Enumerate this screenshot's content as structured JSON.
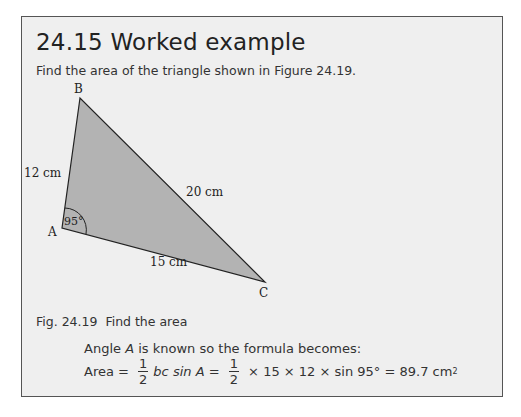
{
  "section": {
    "number": "24.15",
    "title": "Worked example",
    "intro": "Find the area of the triangle shown in Figure 24.19."
  },
  "figure": {
    "vertices": {
      "A": "A",
      "B": "B",
      "C": "C"
    },
    "sides": {
      "AB": "12 cm",
      "BC": "20 cm",
      "AC": "15 cm"
    },
    "angle_A": "95°",
    "fill_color": "#b3b3b3",
    "caption_number": "Fig. 24.19",
    "caption_text": "Find the area"
  },
  "solution": {
    "line1_pre": "Angle ",
    "line1_var": "A",
    "line1_post": " is known so the formula becomes:",
    "area_label": "Area = ",
    "frac_num": "1",
    "frac_den": "2",
    "formula_mid": "bc sin A = ",
    "formula_tail": " × 15 × 12 × sin 95° = 89.7 cm",
    "unit_power": "2"
  }
}
